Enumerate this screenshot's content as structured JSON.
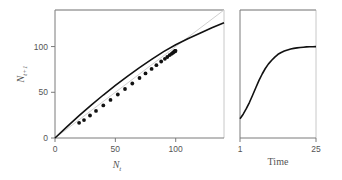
{
  "chart_data": [
    {
      "type": "scatter",
      "panel": "left",
      "title": "",
      "xlabel": "N_t",
      "xlabel_main": "N",
      "xlabel_sub": "t",
      "ylabel": "N_{t+1}",
      "ylabel_main": "N",
      "ylabel_sub": "t+1",
      "xlim": [
        0,
        140
      ],
      "ylim": [
        0,
        140
      ],
      "xticks": [
        0,
        50,
        100
      ],
      "xtick_labels": [
        "0",
        "50",
        "100"
      ],
      "yticks": [
        0,
        50,
        100
      ],
      "ytick_labels": [
        "0",
        "50",
        "100"
      ],
      "grid": false,
      "series": [
        {
          "name": "identity line",
          "kind": "line",
          "color": "#d0d0d0",
          "x": [
            0,
            140
          ],
          "y": [
            0,
            140
          ]
        },
        {
          "name": "recruitment curve",
          "kind": "line",
          "color": "#111111",
          "x": [
            0,
            10,
            20,
            30,
            40,
            50,
            60,
            70,
            80,
            90,
            100,
            110,
            120,
            130,
            140
          ],
          "y": [
            0,
            12.5,
            24.5,
            36,
            47,
            57.5,
            67.5,
            77,
            86,
            94.5,
            102,
            108.5,
            114.5,
            120.5,
            126
          ]
        },
        {
          "name": "observed",
          "kind": "points",
          "color": "#111111",
          "x": [
            20,
            24,
            29,
            34,
            40,
            46,
            52,
            58,
            64,
            70,
            75,
            80,
            84,
            88,
            91,
            93,
            95,
            96.5,
            97.5,
            98.3,
            98.9,
            99.3,
            99.6,
            99.8
          ],
          "y": [
            21,
            24,
            29,
            34,
            40,
            46,
            52,
            58,
            64,
            70,
            75,
            80,
            84,
            88,
            91,
            93,
            95,
            96.5,
            97.5,
            98.3,
            98.9,
            99.3,
            99.6,
            99.8
          ]
        }
      ]
    },
    {
      "type": "line",
      "panel": "right",
      "title": "",
      "xlabel": "Time",
      "ylabel": "",
      "xlim": [
        1,
        25
      ],
      "ylim": [
        0,
        140
      ],
      "xticks": [
        1,
        25
      ],
      "xtick_labels": [
        "1",
        "25"
      ],
      "grid": false,
      "series": [
        {
          "name": "population",
          "color": "#111111",
          "x": [
            1,
            2,
            3,
            4,
            5,
            6,
            7,
            8,
            9,
            10,
            11,
            12,
            13,
            14,
            15,
            16,
            17,
            18,
            19,
            20,
            21,
            22,
            23,
            24,
            25
          ],
          "y": [
            21,
            26,
            32,
            39,
            47,
            55,
            63,
            70,
            76,
            81,
            85,
            88.5,
            91.5,
            93.5,
            95,
            96.3,
            97.3,
            98,
            98.6,
            99,
            99.3,
            99.6,
            99.8,
            99.9,
            100
          ]
        }
      ]
    }
  ]
}
